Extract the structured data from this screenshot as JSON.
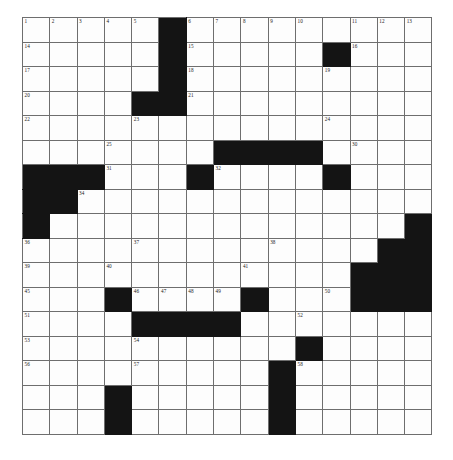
{
  "puzzle": {
    "kind": "crossword-grid",
    "columns": 15,
    "rows": 17,
    "colors": {
      "block": "#141414",
      "cell": "#fdfdfd",
      "grid_line": "#6e6e6e",
      "number": "#1a1a1a",
      "page_background": "#ffffff"
    },
    "geometry": {
      "left": 22,
      "top": 17,
      "cell_width": 27.3,
      "cell_height": 24.5
    },
    "blocks": [
      [
        1,
        6
      ],
      [
        2,
        6
      ],
      [
        2,
        12
      ],
      [
        3,
        6
      ],
      [
        4,
        5
      ],
      [
        4,
        6
      ],
      [
        6,
        8
      ],
      [
        6,
        9
      ],
      [
        6,
        10
      ],
      [
        6,
        11
      ],
      [
        7,
        1
      ],
      [
        7,
        2
      ],
      [
        7,
        3
      ],
      [
        7,
        7
      ],
      [
        7,
        12
      ],
      [
        8,
        1
      ],
      [
        8,
        2
      ],
      [
        9,
        1
      ],
      [
        9,
        15
      ],
      [
        10,
        14
      ],
      [
        10,
        15
      ],
      [
        11,
        13
      ],
      [
        11,
        14
      ],
      [
        11,
        15
      ],
      [
        12,
        4
      ],
      [
        12,
        9
      ],
      [
        12,
        13
      ],
      [
        12,
        14
      ],
      [
        12,
        15
      ],
      [
        13,
        5
      ],
      [
        13,
        6
      ],
      [
        13,
        7
      ],
      [
        13,
        8
      ],
      [
        14,
        11
      ],
      [
        15,
        10
      ],
      [
        16,
        4
      ],
      [
        16,
        10
      ],
      [
        17,
        4
      ],
      [
        17,
        10
      ]
    ],
    "numbers": [
      {
        "n": 1,
        "row": 1,
        "col": 1
      },
      {
        "n": 2,
        "row": 1,
        "col": 2
      },
      {
        "n": 3,
        "row": 1,
        "col": 3
      },
      {
        "n": 4,
        "row": 1,
        "col": 4
      },
      {
        "n": 5,
        "row": 1,
        "col": 5
      },
      {
        "n": 6,
        "row": 1,
        "col": 7
      },
      {
        "n": 7,
        "row": 1,
        "col": 8
      },
      {
        "n": 8,
        "row": 1,
        "col": 9
      },
      {
        "n": 9,
        "row": 1,
        "col": 10
      },
      {
        "n": 10,
        "row": 1,
        "col": 11
      },
      {
        "n": 11,
        "row": 1,
        "col": 13
      },
      {
        "n": 12,
        "row": 1,
        "col": 14
      },
      {
        "n": 13,
        "row": 1,
        "col": 15
      },
      {
        "n": 14,
        "row": 2,
        "col": 1
      },
      {
        "n": 15,
        "row": 2,
        "col": 7
      },
      {
        "n": 16,
        "row": 2,
        "col": 13
      },
      {
        "n": 17,
        "row": 3,
        "col": 1
      },
      {
        "n": 18,
        "row": 3,
        "col": 7
      },
      {
        "n": 19,
        "row": 3,
        "col": 12
      },
      {
        "n": 20,
        "row": 4,
        "col": 1
      },
      {
        "n": 21,
        "row": 4,
        "col": 7
      },
      {
        "n": 22,
        "row": 5,
        "col": 1
      },
      {
        "n": 23,
        "row": 5,
        "col": 5
      },
      {
        "n": 24,
        "row": 5,
        "col": 12
      },
      {
        "n": 25,
        "row": 6,
        "col": 4
      },
      {
        "n": 26,
        "row": 6,
        "col": 8
      },
      {
        "n": 27,
        "row": 6,
        "col": 9
      },
      {
        "n": 28,
        "row": 6,
        "col": 10
      },
      {
        "n": 29,
        "row": 6,
        "col": 11
      },
      {
        "n": 30,
        "row": 6,
        "col": 13
      },
      {
        "n": 31,
        "row": 7,
        "col": 4
      },
      {
        "n": 32,
        "row": 7,
        "col": 8
      },
      {
        "n": 33,
        "row": 7,
        "col": 12
      },
      {
        "n": 34,
        "row": 8,
        "col": 3
      },
      {
        "n": 35,
        "row": 9,
        "col": 1
      },
      {
        "n": 36,
        "row": 10,
        "col": 1
      },
      {
        "n": 37,
        "row": 10,
        "col": 5
      },
      {
        "n": 38,
        "row": 10,
        "col": 10
      },
      {
        "n": 39,
        "row": 11,
        "col": 1
      },
      {
        "n": 40,
        "row": 11,
        "col": 4
      },
      {
        "n": 41,
        "row": 11,
        "col": 9
      },
      {
        "n": 42,
        "row": 11,
        "col": 13
      },
      {
        "n": 43,
        "row": 11,
        "col": 14
      },
      {
        "n": 44,
        "row": 11,
        "col": 15
      },
      {
        "n": 45,
        "row": 12,
        "col": 1
      },
      {
        "n": 46,
        "row": 12,
        "col": 5
      },
      {
        "n": 47,
        "row": 12,
        "col": 6
      },
      {
        "n": 48,
        "row": 12,
        "col": 7
      },
      {
        "n": 49,
        "row": 12,
        "col": 8
      },
      {
        "n": 50,
        "row": 12,
        "col": 12
      },
      {
        "n": 51,
        "row": 13,
        "col": 1
      },
      {
        "n": 52,
        "row": 13,
        "col": 11
      },
      {
        "n": 53,
        "row": 14,
        "col": 1
      },
      {
        "n": 54,
        "row": 14,
        "col": 5
      },
      {
        "n": 55,
        "row": 14,
        "col": 11
      },
      {
        "n": 56,
        "row": 15,
        "col": 1
      },
      {
        "n": 57,
        "row": 15,
        "col": 5
      },
      {
        "n": 58,
        "row": 15,
        "col": 11
      }
    ]
  }
}
